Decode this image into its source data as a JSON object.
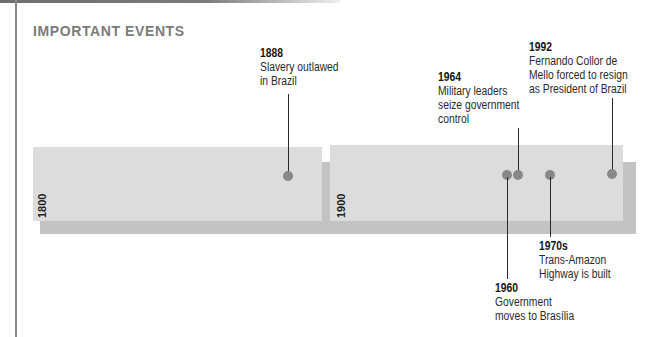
{
  "title": "IMPORTANT EVENTS",
  "colors": {
    "band": "#dcdcdc",
    "shadow": "#c3c3c3",
    "dot": "#888888",
    "title": "#7b7b7b",
    "text": "#2a2a2a"
  },
  "bands": [
    {
      "label": "1800",
      "start_year": 1800,
      "end_year": 1900
    },
    {
      "label": "1900",
      "start_year": 1900,
      "end_year": 2000
    }
  ],
  "events": [
    {
      "year_label": "1888",
      "year": 1888,
      "description": "Slavery outlawed\nin Brazil",
      "label_side": "above"
    },
    {
      "year_label": "1960",
      "year": 1960,
      "description": "Government\nmoves to Brasília",
      "label_side": "below"
    },
    {
      "year_label": "1964",
      "year": 1964,
      "description": "Military leaders\nseize government\ncontrol",
      "label_side": "above"
    },
    {
      "year_label": "1970s",
      "year": 1973,
      "description": "Trans-Amazon\nHighway is built",
      "label_side": "below"
    },
    {
      "year_label": "1992",
      "year": 1992,
      "description": "Fernando Collor de\nMello forced to resign\nas President of Brazil",
      "label_side": "above"
    }
  ]
}
